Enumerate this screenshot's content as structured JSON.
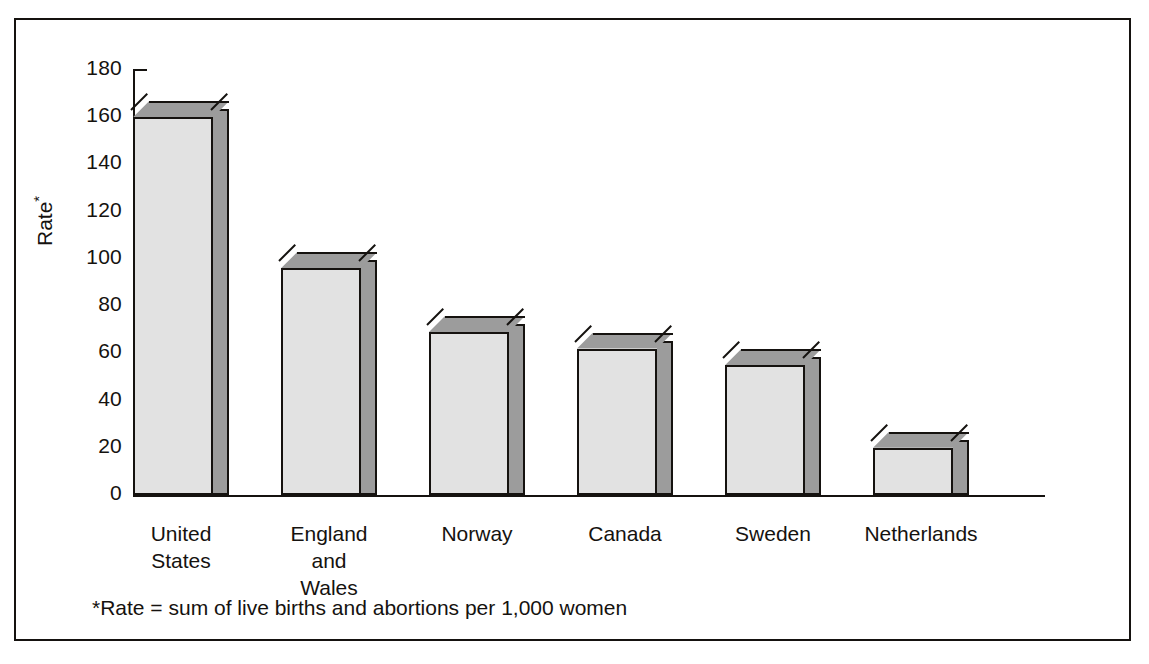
{
  "chart_data": {
    "type": "bar",
    "title": "",
    "subtitle": "",
    "xlabel": "",
    "ylabel": "Rate*",
    "ylim": [
      0,
      180
    ],
    "ytick_step": 20,
    "yticks": [
      180,
      160,
      140,
      120,
      100,
      80,
      60,
      40,
      20,
      0
    ],
    "grid": false,
    "legend": null,
    "style": "3d-block-bars",
    "categories": [
      "United\nStates",
      "England\nand\nWales",
      "Norway",
      "Canada",
      "Sweden",
      "Netherlands"
    ],
    "values": [
      160,
      96,
      69,
      62,
      55,
      20
    ],
    "annotations": [
      "*Rate = sum of live births and abortions per 1,000 women"
    ]
  },
  "axes": {
    "y_title_text": "Rate",
    "y_title_superscript": "*",
    "tick_labels": [
      "180",
      "160",
      "140",
      "120",
      "100",
      "80",
      "60",
      "40",
      "20",
      "0"
    ]
  },
  "footnote": {
    "text": "*Rate = sum of live births and abortions per 1,000 women"
  },
  "colors": {
    "bar_front": "#e2e2e2",
    "bar_side": "#9c9c9c",
    "bar_top": "#9c9c9c",
    "outline": "#15120f",
    "background": "#ffffff",
    "frame": "#15120f"
  }
}
